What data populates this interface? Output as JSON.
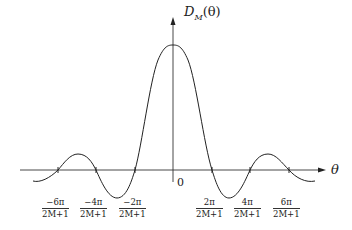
{
  "diagram": {
    "y_axis_label": {
      "main": "D",
      "sub": "M",
      "arg": "(θ)"
    },
    "x_axis_label": "θ",
    "origin_label": "0",
    "tick_labels": [
      {
        "num": "−6π",
        "den": "2M+1",
        "x": 58
      },
      {
        "num": "−4π",
        "den": "2M+1",
        "x": 96
      },
      {
        "num": "−2π",
        "den": "2M+1",
        "x": 135
      },
      {
        "num": "2π",
        "den": "2M+1",
        "x": 212
      },
      {
        "num": "4π",
        "den": "2M+1",
        "x": 250
      },
      {
        "num": "6π",
        "den": "2M+1",
        "x": 289
      }
    ],
    "curve_description": "Dirichlet kernel D_M(θ): central peak at θ=0, zero crossings at ±2kπ/(2M+1), decaying side lobes",
    "colors": {
      "line": "#222222",
      "background": "#ffffff"
    }
  }
}
